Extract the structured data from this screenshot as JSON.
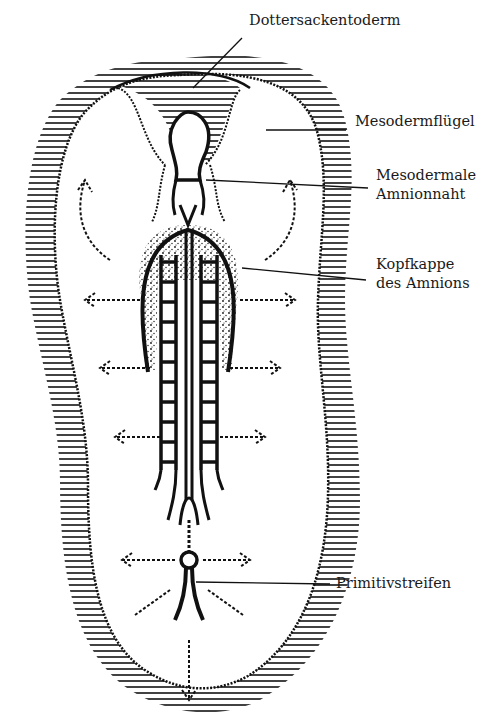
{
  "figure": {
    "type": "embryo-schematic",
    "colors": {
      "ink": "#111111",
      "background": "#ffffff"
    },
    "labels": [
      {
        "id": "dottersackentoderm",
        "lines": [
          "Dottersackentoderm"
        ]
      },
      {
        "id": "mesodermfluegel",
        "lines": [
          "Mesodermflügel"
        ]
      },
      {
        "id": "mesodermale-amnionnaht",
        "lines": [
          "Mesodermale",
          "Amnionnaht"
        ]
      },
      {
        "id": "kopfkappe",
        "lines": [
          "Kopfkappe",
          "des Amnions"
        ]
      },
      {
        "id": "primitivstreifen",
        "lines": [
          "Primitivstreifen"
        ]
      }
    ]
  }
}
